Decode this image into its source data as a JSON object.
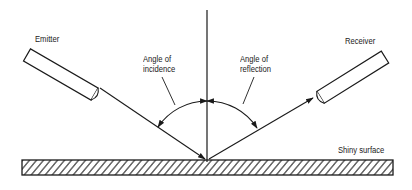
{
  "diagram": {
    "labels": {
      "emitter": "Emitter",
      "receiver": "Receiver",
      "incidence_line1": "Angle of",
      "incidence_line2": "incidence",
      "reflection_line1": "Angle of",
      "reflection_line2": "reflection",
      "surface": "Shiny surface"
    },
    "colors": {
      "line": "#1a1a1a",
      "background": "#ffffff"
    }
  }
}
